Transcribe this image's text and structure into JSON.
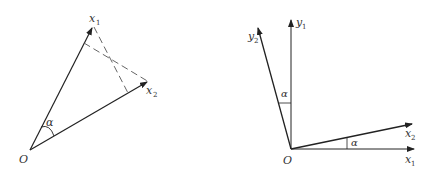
{
  "left_diagram": {
    "origin_label": "O",
    "vector1_label": "x",
    "vector1_sub": "1",
    "vector2_label": "x",
    "vector2_sub": "2",
    "angle_label": "α"
  },
  "right_diagram": {
    "origin_label": "O",
    "y1_label": "y",
    "y1_sub": "1",
    "y2_label": "y",
    "y2_sub": "2",
    "x1_label": "x",
    "x1_sub": "1",
    "x2_label": "x",
    "x2_sub": "2",
    "angle_top_label": "α",
    "angle_bottom_label": "α"
  },
  "colors": {
    "line": "#222222",
    "dash": "#555555",
    "text": "#333333"
  }
}
